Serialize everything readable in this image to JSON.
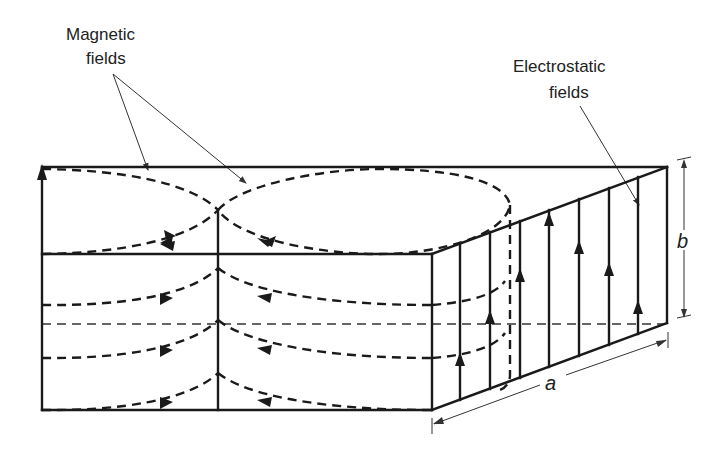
{
  "figure": {
    "type": "waveguide-field-diagram",
    "labels": {
      "magnetic_line1": "Magnetic",
      "magnetic_line2": "fields",
      "electrostatic_line1": "Electrostatic",
      "electrostatic_line2": "fields",
      "dim_a": "a",
      "dim_b": "b"
    },
    "colors": {
      "line": "#1a1a1a",
      "background": "#ffffff"
    }
  }
}
